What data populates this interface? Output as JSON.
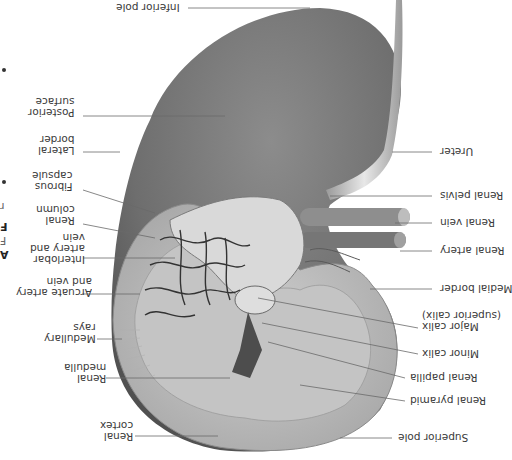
{
  "figure": {
    "orientation_deg": 180,
    "colors": {
      "background": "#ffffff",
      "tissue_dark": "#5a5a5a",
      "tissue_mid": "#9a9a9a",
      "tissue_light": "#d8d8d8",
      "label_text": "#3a3a3a",
      "leader_line": "#6a6a6a"
    }
  },
  "labels_left": [
    {
      "id": "inferior-pole",
      "text": "Inferior pole"
    },
    {
      "id": "posterior-surface",
      "text": "Posterior\nsurface"
    },
    {
      "id": "lateral-border",
      "text": "Lateral\nborder"
    },
    {
      "id": "fibrous-capsule",
      "text": "Fibrous\ncapsule"
    },
    {
      "id": "renal-column",
      "text": "Renal\ncolumn"
    },
    {
      "id": "interlobar",
      "text": "Interlobar\nartery and\nvein"
    },
    {
      "id": "arcuate",
      "text": "Arcuate artery\nand vein"
    },
    {
      "id": "medullary-rays",
      "text": "Medullary\nrays"
    },
    {
      "id": "renal-medulla",
      "text": "Renal\nmedulla"
    },
    {
      "id": "renal-cortex",
      "text": "Renal\ncortex"
    }
  ],
  "labels_right": [
    {
      "id": "ureter",
      "text": "Ureter"
    },
    {
      "id": "renal-pelvis",
      "text": "Renal pelvis"
    },
    {
      "id": "renal-vein",
      "text": "Renal vein"
    },
    {
      "id": "renal-artery",
      "text": "Renal artery"
    },
    {
      "id": "medial-border",
      "text": "Medial border"
    },
    {
      "id": "major-calix",
      "text": "Major calix\n(superior calix)"
    },
    {
      "id": "minor-calix",
      "text": "Minor calix"
    },
    {
      "id": "renal-papilla",
      "text": "Renal papilla"
    },
    {
      "id": "renal-pyramid",
      "text": "Renal pyramid"
    },
    {
      "id": "superior-pole",
      "text": "Superior pole"
    }
  ],
  "edge_fragments": [
    "A",
    "F",
    "F",
    "r"
  ]
}
